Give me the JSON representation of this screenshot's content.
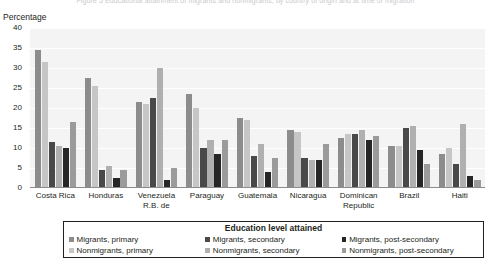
{
  "caption": {
    "cut_text": "Figure 5  Educational attainment of migrants and nonmigrants, by country of origin and at time of migration"
  },
  "axis": {
    "y_title": "Percentage",
    "y_ticks": [
      "40",
      "35",
      "30",
      "25",
      "20",
      "15",
      "10",
      "5",
      "0"
    ]
  },
  "legend": {
    "title": "Education level attained",
    "items": [
      {
        "label": "Migrants, primary",
        "color": "#8c8c8c"
      },
      {
        "label": "Migrants, secondary",
        "color": "#494949"
      },
      {
        "label": "Migrants, post-secondary",
        "color": "#262626"
      },
      {
        "label": "Nonmigrants, primary",
        "color": "#c6c6c6"
      },
      {
        "label": "Nonmigrants, secondary",
        "color": "#b0b0b0"
      },
      {
        "label": "Nonmigrants, post-secondary",
        "color": "#9b9b9b"
      }
    ]
  },
  "chart_data": {
    "type": "bar",
    "title": "",
    "xlabel": "",
    "ylabel": "Percentage",
    "ylim": [
      0,
      40
    ],
    "ytick_step": 5,
    "grid": true,
    "legend_position": "bottom",
    "categories": [
      "Costa Rica",
      "Honduras",
      "Venezuela, R.B. de",
      "Paraguay",
      "Guatemala",
      "Nicaragua",
      "Dominican Republic",
      "Brazil",
      "Haiti"
    ],
    "series": [
      {
        "name": "Migrants, primary",
        "color": "#8c8c8c",
        "values": [
          34.5,
          27.5,
          21.5,
          23.5,
          17.5,
          14.5,
          12.5,
          10.5,
          8.5
        ]
      },
      {
        "name": "Nonmigrants, primary",
        "color": "#c6c6c6",
        "values": [
          31.5,
          25.5,
          21.0,
          20.0,
          17.0,
          14.0,
          13.5,
          10.5,
          10.0
        ]
      },
      {
        "name": "Migrants, secondary",
        "color": "#494949",
        "values": [
          11.5,
          4.5,
          22.5,
          10.0,
          8.0,
          7.5,
          13.5,
          15.0,
          6.0
        ]
      },
      {
        "name": "Nonmigrants, secondary",
        "color": "#b0b0b0",
        "values": [
          10.5,
          5.5,
          30.0,
          12.0,
          11.0,
          7.0,
          14.5,
          15.5,
          16.0
        ]
      },
      {
        "name": "Migrants, post-secondary",
        "color": "#262626",
        "values": [
          10.0,
          2.5,
          2.0,
          8.5,
          4.0,
          7.0,
          12.0,
          9.5,
          3.0
        ]
      },
      {
        "name": "Nonmigrants, post-secondary",
        "color": "#9b9b9b",
        "values": [
          16.5,
          4.5,
          5.0,
          12.0,
          7.5,
          11.0,
          13.0,
          6.0,
          2.0
        ]
      }
    ]
  }
}
